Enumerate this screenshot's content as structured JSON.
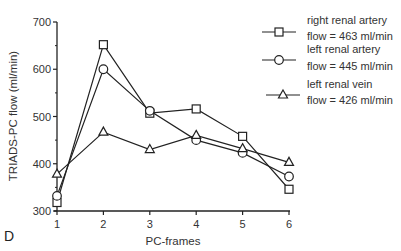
{
  "panel_label": "D",
  "chart_data": {
    "type": "line",
    "title": "",
    "xlabel": "PC-frames",
    "ylabel": "TRIADS-PC flow (ml/min)",
    "x": [
      1,
      2,
      3,
      4,
      5,
      6
    ],
    "xticks": [
      "1",
      "2",
      "3",
      "4",
      "5",
      "6"
    ],
    "yticks": [
      "300",
      "400",
      "500",
      "600",
      "700"
    ],
    "ylim": [
      300,
      700
    ],
    "xlim": [
      1,
      6
    ],
    "grid": false,
    "legend_position": "upper right",
    "series": [
      {
        "name": "right renal artery",
        "label_line1": "right renal artery",
        "label_line2": "flow = 463 ml/min",
        "marker": "square",
        "values": [
          318,
          652,
          507,
          516,
          458,
          346
        ]
      },
      {
        "name": "left renal artery",
        "label_line1": "left renal artery",
        "label_line2": "flow = 445 ml/min",
        "marker": "circle",
        "values": [
          332,
          600,
          512,
          450,
          423,
          373
        ]
      },
      {
        "name": "left renal vein",
        "label_line1": "left renal vein",
        "label_line2": "flow = 426 ml/min",
        "marker": "triangle",
        "values": [
          378,
          467,
          430,
          460,
          432,
          403
        ]
      }
    ]
  }
}
